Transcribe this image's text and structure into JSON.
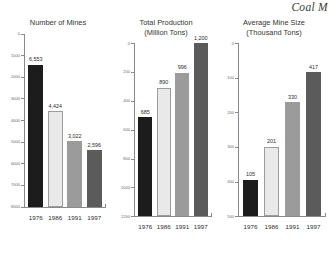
{
  "running_head": "Coal M",
  "chart_data": [
    {
      "type": "bar",
      "title": "Number of Mines",
      "subtitle": "",
      "xlabel": "",
      "ylabel": "",
      "categories": [
        "1976",
        "1986",
        "1991",
        "1997"
      ],
      "values": [
        6553,
        4424,
        3022,
        2596
      ],
      "value_labels": [
        "6,553",
        "4,424",
        "3,022",
        "2,596"
      ],
      "ylim": [
        0,
        8000
      ],
      "yticks": [
        0,
        1000,
        2000,
        3000,
        4000,
        5000,
        6000,
        7000,
        8000
      ],
      "ytick_labels": [
        "0",
        "1000",
        "2000",
        "3000",
        "4000",
        "5000",
        "6000",
        "7000",
        "8000"
      ],
      "grid": false,
      "legend": "none",
      "bar_colors": [
        "#1c1c1c",
        "#e9e9e9",
        "#9b9b9b",
        "#5b5b5b"
      ]
    },
    {
      "type": "bar",
      "title": "Total Production",
      "subtitle": "(Million Tons)",
      "xlabel": "",
      "ylabel": "",
      "categories": [
        "1976",
        "1986",
        "1991",
        "1997"
      ],
      "values": [
        685,
        890,
        996,
        1200
      ],
      "value_labels": [
        "685",
        "890",
        "996",
        "1,200"
      ],
      "ylim": [
        0,
        1200
      ],
      "yticks": [
        0,
        200,
        400,
        600,
        800,
        1000,
        1200
      ],
      "ytick_labels": [
        "0",
        "200",
        "400",
        "600",
        "800",
        "1000",
        "1200"
      ],
      "grid": false,
      "legend": "none",
      "bar_colors": [
        "#1c1c1c",
        "#e9e9e9",
        "#9b9b9b",
        "#5b5b5b"
      ]
    },
    {
      "type": "bar",
      "title": "Average Mine Size",
      "subtitle": "(Thousand Tons)",
      "xlabel": "",
      "ylabel": "",
      "categories": [
        "1976",
        "1986",
        "1991",
        "1997"
      ],
      "values": [
        105,
        201,
        330,
        417
      ],
      "value_labels": [
        "105",
        "201",
        "330",
        "417"
      ],
      "ylim": [
        0,
        500
      ],
      "yticks": [
        0,
        100,
        200,
        300,
        400,
        500
      ],
      "ytick_labels": [
        "0",
        "100",
        "200",
        "300",
        "400",
        "500"
      ],
      "grid": false,
      "legend": "none",
      "bar_colors": [
        "#1c1c1c",
        "#e9e9e9",
        "#9b9b9b",
        "#5b5b5b"
      ]
    }
  ]
}
